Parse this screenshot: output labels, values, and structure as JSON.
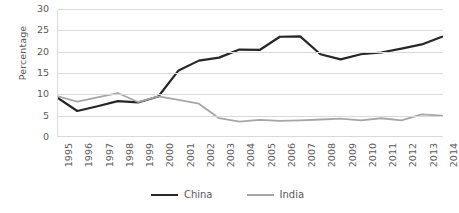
{
  "chart_data": {
    "type": "line",
    "title": "",
    "xlabel": "",
    "ylabel": "Percentage",
    "ylim": [
      0,
      30
    ],
    "yticks": [
      0,
      5,
      10,
      15,
      20,
      25,
      30
    ],
    "grid": true,
    "legend_position": "bottom-center",
    "categories": [
      "1995",
      "1996",
      "1997",
      "1998",
      "1999",
      "2000",
      "2001",
      "2002",
      "2003",
      "2004",
      "2005",
      "2006",
      "2007",
      "2008",
      "2009",
      "2010",
      "2011",
      "2012",
      "2013",
      "2014"
    ],
    "series": [
      {
        "name": "China",
        "color": "#262626",
        "values": [
          9.3,
          6.1,
          7.2,
          8.4,
          8.1,
          9.5,
          15.6,
          17.9,
          18.6,
          20.5,
          20.4,
          23.5,
          23.6,
          19.4,
          18.2,
          19.4,
          19.8,
          20.7,
          21.7,
          23.5
        ]
      },
      {
        "name": "India",
        "color": "#a6a6a6",
        "values": [
          9.6,
          8.3,
          9.3,
          10.3,
          8.2,
          9.5,
          8.7,
          7.8,
          4.4,
          3.6,
          4.0,
          3.8,
          3.9,
          4.1,
          4.3,
          3.9,
          4.4,
          3.9,
          5.3,
          5.0
        ]
      }
    ]
  },
  "yticklabels": [
    "30",
    "25",
    "20",
    "15",
    "10",
    "5",
    "0"
  ],
  "legend": {
    "items": [
      {
        "label": "China",
        "color": "#262626",
        "thickness": "2.4px"
      },
      {
        "label": "India",
        "color": "#a6a6a6",
        "thickness": "2.0px"
      }
    ]
  }
}
